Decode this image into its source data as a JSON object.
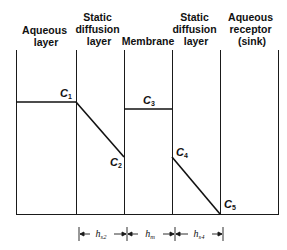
{
  "regions": [
    {
      "label_lines": [
        "Aqueous",
        "layer"
      ]
    },
    {
      "label_lines": [
        "Static",
        "diffusion",
        "layer"
      ]
    },
    {
      "label_lines": [
        "Membrane"
      ]
    },
    {
      "label_lines": [
        "Static",
        "diffusion",
        "layer"
      ]
    },
    {
      "label_lines": [
        "Aqueous",
        "receptor",
        "(sink)"
      ]
    }
  ],
  "concentrations": [
    {
      "main": "C",
      "sub": "1"
    },
    {
      "main": "C",
      "sub": "2"
    },
    {
      "main": "C",
      "sub": "3"
    },
    {
      "main": "C",
      "sub": "4"
    },
    {
      "main": "C",
      "sub": "5"
    }
  ],
  "thicknesses": [
    {
      "main": "h",
      "sub": "s2"
    },
    {
      "main": "h",
      "sub": "m"
    },
    {
      "main": "h",
      "sub": "s4"
    }
  ],
  "colors": {
    "line": "#1a1a1a",
    "background": "#ffffff"
  }
}
